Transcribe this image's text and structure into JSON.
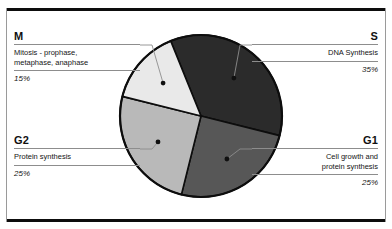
{
  "figure": {
    "frame_color": "#0d0d0d",
    "background": "#ffffff"
  },
  "chart_data": {
    "type": "pie",
    "title": "",
    "xlabel": "",
    "ylabel": "",
    "legend_position": "callout-labels",
    "grid": false,
    "categories": [
      "S",
      "G1",
      "G2",
      "M"
    ],
    "values": [
      35,
      25,
      25,
      15
    ],
    "value_unit": "%",
    "start_angle_deg": -22,
    "direction": "clockwise",
    "slices": [
      {
        "key": "S",
        "heading": "S",
        "description": "DNA Synthesis",
        "percent_label": "35%",
        "value": 35,
        "color": "#2b2b2b",
        "side": "right"
      },
      {
        "key": "G1",
        "heading": "G1",
        "description": "Cell growth and\nprotein synthesis",
        "percent_label": "25%",
        "value": 25,
        "color": "#575757",
        "side": "right"
      },
      {
        "key": "G2",
        "heading": "G2",
        "description": "Protein synthesis",
        "percent_label": "25%",
        "value": 25,
        "color": "#b9b9b9",
        "side": "left"
      },
      {
        "key": "M",
        "heading": "M",
        "description": "Mitosis - prophase,\nmetaphase, anaphase",
        "percent_label": "15%",
        "value": 15,
        "color": "#e9e9e9",
        "side": "left"
      }
    ],
    "outline_color": "#0d0d0d",
    "leader_color": "#8d8d8d",
    "marker_color": "#101010"
  }
}
